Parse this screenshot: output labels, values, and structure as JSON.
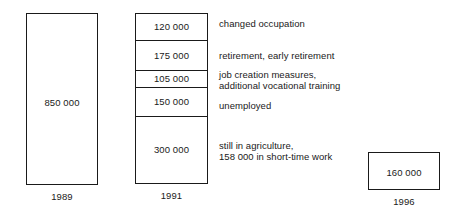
{
  "chart_data": {
    "type": "bar",
    "title": "",
    "subtitle": "",
    "xlabel": "",
    "ylabel": "",
    "grid": false,
    "legend_position": "right-annotations",
    "unit": "persons",
    "categories": [
      "1989",
      "1991",
      "1996"
    ],
    "totals": [
      850000,
      850000,
      160000
    ],
    "series": [
      {
        "name": "changed occupation",
        "values": [
          null,
          120000,
          null
        ]
      },
      {
        "name": "retirement, early retirement",
        "values": [
          null,
          175000,
          null
        ]
      },
      {
        "name": "job creation measures, additional vocational training",
        "values": [
          null,
          105000,
          null
        ]
      },
      {
        "name": "unemployed",
        "values": [
          null,
          150000,
          null
        ]
      },
      {
        "name": "still in agriculture, 158 000 in short-time work",
        "values": [
          null,
          300000,
          null
        ]
      }
    ]
  },
  "columns": {
    "left": {
      "year": "1989",
      "value_label": "850 000"
    },
    "middle": {
      "year": "1991",
      "segments": [
        {
          "value_label": "120 000",
          "annotation_line_1": "changed occupation",
          "annotation_line_2": ""
        },
        {
          "value_label": "175 000",
          "annotation_line_1": "retirement, early retirement",
          "annotation_line_2": ""
        },
        {
          "value_label": "105 000",
          "annotation_line_1": "job creation measures,",
          "annotation_line_2": "additional vocational training"
        },
        {
          "value_label": "150 000",
          "annotation_line_1": "unemployed",
          "annotation_line_2": ""
        },
        {
          "value_label": "300 000",
          "annotation_line_1": "still in agriculture,",
          "annotation_line_2": "158 000 in short-time work"
        }
      ]
    },
    "right": {
      "year": "1996",
      "value_label": "160 000"
    }
  },
  "annotations": [
    "changed occupation",
    "retirement, early retirement",
    "job creation measures,\nadditional vocational training",
    "unemployed",
    "still in agriculture,\n158 000 in short-time work"
  ],
  "colors": {
    "ink": "#1a1a1a",
    "background": "#ffffff"
  }
}
